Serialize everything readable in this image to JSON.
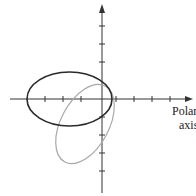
{
  "diagram": {
    "type": "polar-coordinate-plot",
    "axis_label_line1": "Polar",
    "axis_label_line2": "axis",
    "colors": {
      "axis": "#333333",
      "curve_dark": "#2a2a2a",
      "curve_light": "#a8a8a8",
      "background": "#ffffff"
    },
    "curves": [
      {
        "name": "dark-ellipse",
        "description": "Ellipse centered on polar axis, extending left of pole"
      },
      {
        "name": "light-ellipse",
        "description": "Rotated ellipse, tilted, extending below polar axis"
      }
    ],
    "horizontal_ticks": 7,
    "vertical_ticks": 7
  }
}
